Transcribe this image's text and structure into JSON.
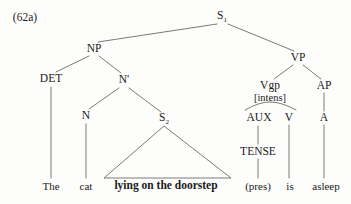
{
  "figure": {
    "example_number": "(62a)",
    "line_color": "#6b6b6b",
    "text_color": "#1a1a1a",
    "background": "#fdfdfc"
  },
  "nodes": [
    {
      "id": "s1",
      "text": "S",
      "sub": "1",
      "x": 222,
      "y": 17,
      "kind": "cat"
    },
    {
      "id": "np",
      "text": "NP",
      "sub": "",
      "x": 94,
      "y": 49,
      "kind": "cat"
    },
    {
      "id": "vp",
      "text": "VP",
      "sub": "",
      "x": 298,
      "y": 58,
      "kind": "cat"
    },
    {
      "id": "det",
      "text": "DET",
      "sub": "",
      "x": 51,
      "y": 79,
      "kind": "cat"
    },
    {
      "id": "nbar",
      "text": "N'",
      "sub": "",
      "x": 124,
      "y": 80,
      "kind": "cat"
    },
    {
      "id": "vgp",
      "text": "Vgp",
      "sub": "",
      "x": 270,
      "y": 86,
      "kind": "cat"
    },
    {
      "id": "ap",
      "text": "AP",
      "sub": "",
      "x": 324,
      "y": 86,
      "kind": "cat"
    },
    {
      "id": "intens",
      "text": "[intens]",
      "sub": "",
      "x": 270,
      "y": 98,
      "kind": "feat"
    },
    {
      "id": "n",
      "text": "N",
      "sub": "",
      "x": 86,
      "y": 116,
      "kind": "cat"
    },
    {
      "id": "s2",
      "text": "S",
      "sub": "2",
      "x": 164,
      "y": 119,
      "kind": "cat"
    },
    {
      "id": "aux",
      "text": "AUX",
      "sub": "",
      "x": 259,
      "y": 118,
      "kind": "cat"
    },
    {
      "id": "v",
      "text": "V",
      "sub": "",
      "x": 289,
      "y": 118,
      "kind": "cat"
    },
    {
      "id": "a",
      "text": "A",
      "sub": "",
      "x": 324,
      "y": 118,
      "kind": "cat"
    },
    {
      "id": "tense",
      "text": "TENSE",
      "sub": "",
      "x": 258,
      "y": 152,
      "kind": "cat"
    },
    {
      "id": "the",
      "text": "The",
      "sub": "",
      "x": 51,
      "y": 186,
      "kind": "leaf"
    },
    {
      "id": "cat",
      "text": "cat",
      "sub": "",
      "x": 86,
      "y": 186,
      "kind": "leaf"
    },
    {
      "id": "lying",
      "text": "lying on the doorstep",
      "sub": "",
      "x": 166,
      "y": 186,
      "kind": "leaf-bold"
    },
    {
      "id": "pres",
      "text": "(pres)",
      "sub": "",
      "x": 258,
      "y": 186,
      "kind": "leaf"
    },
    {
      "id": "is",
      "text": "is",
      "sub": "",
      "x": 290,
      "y": 186,
      "kind": "leaf"
    },
    {
      "id": "asleep",
      "text": "asleep",
      "sub": "",
      "x": 326,
      "y": 186,
      "kind": "leaf"
    }
  ],
  "edges": [
    {
      "id": "s1-np",
      "from": "S1",
      "to": "NP",
      "x1": 217,
      "y1": 24,
      "x2": 98,
      "y2": 42
    },
    {
      "id": "s1-vp",
      "from": "S1",
      "to": "VP",
      "x1": 228,
      "y1": 24,
      "x2": 294,
      "y2": 51
    },
    {
      "id": "np-det",
      "from": "NP",
      "to": "DET",
      "x1": 89,
      "y1": 56,
      "x2": 56,
      "y2": 72
    },
    {
      "id": "np-nbar",
      "from": "NP",
      "to": "N'",
      "x1": 99,
      "y1": 56,
      "x2": 121,
      "y2": 73
    },
    {
      "id": "det-n",
      "from": "DET",
      "to": "The",
      "x1": 51,
      "y1": 87,
      "x2": 51,
      "y2": 178
    },
    {
      "id": "nbar-n",
      "from": "N'",
      "to": "N",
      "x1": 119,
      "y1": 88,
      "x2": 89,
      "y2": 109
    },
    {
      "id": "nbar-s2",
      "from": "N'",
      "to": "S2",
      "x1": 129,
      "y1": 88,
      "x2": 161,
      "y2": 112
    },
    {
      "id": "n-cat",
      "from": "N",
      "to": "cat",
      "x1": 86,
      "y1": 124,
      "x2": 86,
      "y2": 178
    },
    {
      "id": "vp-vgp",
      "from": "VP",
      "to": "Vgp",
      "x1": 293,
      "y1": 65,
      "x2": 274,
      "y2": 79
    },
    {
      "id": "vp-ap",
      "from": "VP",
      "to": "AP",
      "x1": 303,
      "y1": 65,
      "x2": 321,
      "y2": 79
    },
    {
      "id": "ap-a",
      "from": "AP",
      "to": "A",
      "x1": 324,
      "y1": 93,
      "x2": 324,
      "y2": 111
    },
    {
      "id": "a-asleep",
      "from": "A",
      "to": "asleep",
      "x1": 324,
      "y1": 125,
      "x2": 324,
      "y2": 178
    },
    {
      "id": "aux-tense",
      "from": "AUX",
      "to": "TENSE",
      "x1": 258,
      "y1": 126,
      "x2": 258,
      "y2": 144
    },
    {
      "id": "tense-pres",
      "from": "TENSE",
      "to": "(pres)",
      "x1": 258,
      "y1": 159,
      "x2": 258,
      "y2": 178
    },
    {
      "id": "v-is",
      "from": "V",
      "to": "is",
      "x1": 289,
      "y1": 125,
      "x2": 289,
      "y2": 178
    }
  ],
  "brace": {
    "id": "vgp-brace",
    "description": "curved brace joining Vgp[intens] to AUX and V",
    "left_x": 245,
    "right_x": 296,
    "base_y": 110,
    "apex_x": 270,
    "apex_y": 102
  },
  "triangle": {
    "id": "s2-triangle",
    "description": "triangle abbreviating the S2 constituent",
    "apex_x": 164,
    "apex_y": 126,
    "left_x": 104,
    "right_x": 231,
    "base_y": 178
  }
}
